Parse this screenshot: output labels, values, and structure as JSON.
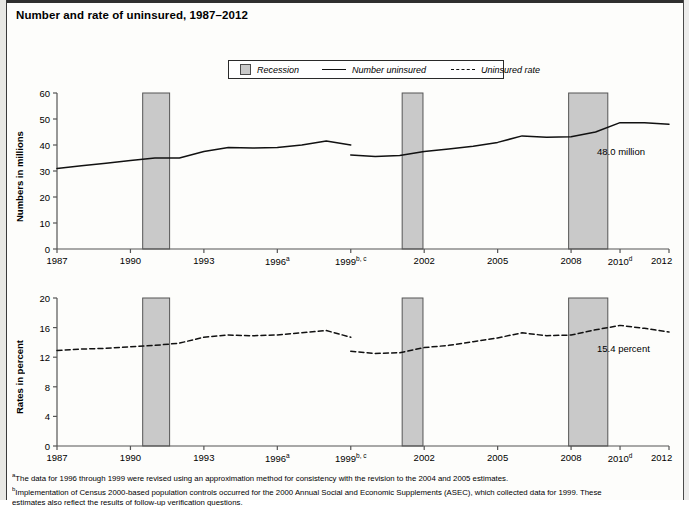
{
  "title": "Number and rate of uninsured, 1987–2012",
  "legend": {
    "recession": "Recession",
    "number_uninsured": "Number uninsured",
    "uninsured_rate": "Uninsured rate"
  },
  "footnotes": [
    "The data for 1996 through 1999 were revised using an approximation method for consistency with the revision to the 2004 and 2005 estimates.",
    "Implementation of Census 2000-based population controls occurred for the 2000 Annual Social and Economic Supplements (ASEC), which collected data for 1999. These",
    "estimates also reflect the results of follow-up verification questions."
  ],
  "footnote_marks": [
    "a",
    "b",
    ""
  ],
  "chart_data": [
    {
      "type": "line",
      "id": "number-uninsured",
      "title": "Number uninsured",
      "ylabel": "Numbers in millions",
      "xlabel": "",
      "ylim": [
        0,
        60
      ],
      "yticks": [
        0,
        10,
        20,
        30,
        40,
        50,
        60
      ],
      "xlim": [
        1987,
        2012
      ],
      "xticks": [
        1987,
        1990,
        1993,
        1996,
        1999,
        2002,
        2005,
        2008,
        2010,
        2012
      ],
      "xtick_labels": [
        "1987",
        "1990",
        "1993",
        "1996a",
        "1999b, c",
        "2002",
        "2005",
        "2008",
        "2010d",
        "2012"
      ],
      "grid": false,
      "annotation": "48.0 million",
      "annotation_value": 48.0,
      "series": [
        {
          "name": "Number uninsured (pre-break)",
          "x": [
            1987,
            1988,
            1989,
            1990,
            1991,
            1992,
            1993,
            1994,
            1995,
            1996,
            1997,
            1998,
            1999
          ],
          "values": [
            31.0,
            32.0,
            33.0,
            34.0,
            35.0,
            35.0,
            37.5,
            39.0,
            38.8,
            39.0,
            40.0,
            41.5,
            40.0
          ]
        },
        {
          "name": "Number uninsured (post-break)",
          "x": [
            1999,
            2000,
            2001,
            2002,
            2003,
            2004,
            2005,
            2006,
            2007,
            2008,
            2009,
            2010,
            2011,
            2012
          ],
          "values": [
            36.2,
            35.6,
            36.0,
            37.5,
            38.5,
            39.5,
            41.0,
            43.5,
            43.0,
            43.2,
            45.0,
            48.6,
            48.6,
            48.0
          ]
        }
      ]
    },
    {
      "type": "line",
      "id": "uninsured-rate",
      "title": "Uninsured rate",
      "ylabel": "Rates in percent",
      "xlabel": "",
      "ylim": [
        0,
        20
      ],
      "yticks": [
        0,
        4,
        8,
        12,
        16,
        20
      ],
      "xlim": [
        1987,
        2012
      ],
      "xticks": [
        1987,
        1990,
        1993,
        1996,
        1999,
        2002,
        2005,
        2008,
        2010,
        2012
      ],
      "xtick_labels": [
        "1987",
        "1990",
        "1993",
        "1996a",
        "1999b, c",
        "2002",
        "2005",
        "2008",
        "2010d",
        "2012"
      ],
      "grid": false,
      "annotation": "15.4 percent",
      "annotation_value": 15.4,
      "series": [
        {
          "name": "Uninsured rate (pre-break)",
          "x": [
            1987,
            1988,
            1989,
            1990,
            1991,
            1992,
            1993,
            1994,
            1995,
            1996,
            1997,
            1998,
            1999
          ],
          "values": [
            12.9,
            13.1,
            13.2,
            13.4,
            13.6,
            13.9,
            14.7,
            15.0,
            14.9,
            15.0,
            15.3,
            15.6,
            14.7
          ]
        },
        {
          "name": "Uninsured rate (post-break)",
          "x": [
            1999,
            2000,
            2001,
            2002,
            2003,
            2004,
            2005,
            2006,
            2007,
            2008,
            2009,
            2010,
            2011,
            2012
          ],
          "values": [
            12.8,
            12.5,
            12.6,
            13.3,
            13.6,
            14.1,
            14.6,
            15.3,
            14.9,
            15.0,
            15.7,
            16.3,
            15.9,
            15.4
          ]
        }
      ],
      "recession_bands": [
        {
          "start": 1990.5,
          "end": 1991.6
        },
        {
          "start": 2001.1,
          "end": 2001.95
        },
        {
          "start": 2007.9,
          "end": 2009.5
        }
      ]
    }
  ],
  "recession_bands": [
    {
      "label": "1990-91 recession",
      "start": 1990.5,
      "end": 1991.6
    },
    {
      "label": "2001 recession",
      "start": 2001.1,
      "end": 2001.95
    },
    {
      "label": "2007-09 recession",
      "start": 2007.9,
      "end": 2009.5
    }
  ],
  "colors": {
    "recession_fill": "#c9c9c9",
    "recession_border": "#555555",
    "line": "#111111",
    "axis": "#555555",
    "page_bg": "#fdfdfb"
  }
}
